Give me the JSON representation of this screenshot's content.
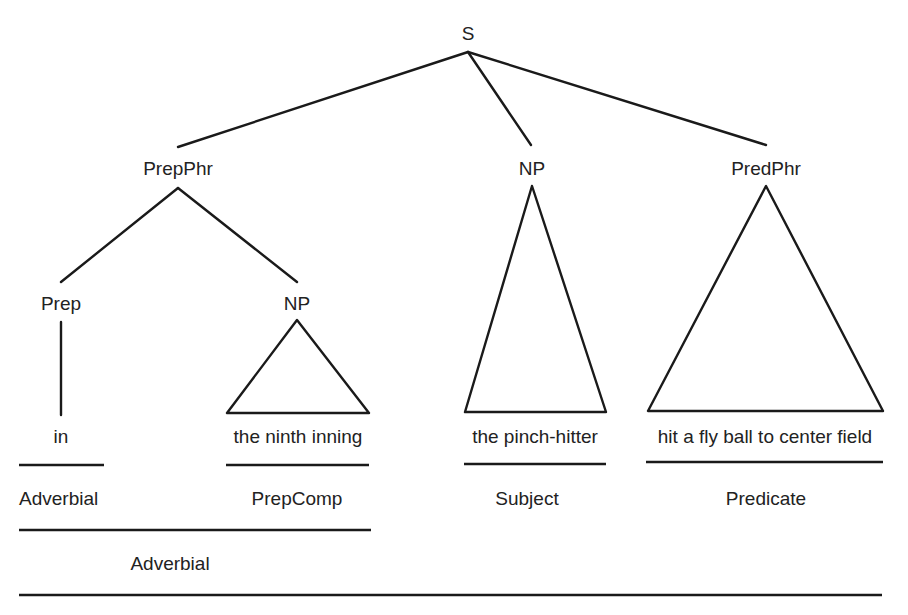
{
  "tree": {
    "root": {
      "label": "S",
      "x": 468,
      "y": 40,
      "apex_y": 52
    },
    "level1": [
      {
        "label": "PrepPhr",
        "x": 178,
        "y": 175,
        "join_y": 147
      },
      {
        "label": "NP",
        "x": 532,
        "y": 175,
        "join_y": 145
      },
      {
        "label": "PredPhr",
        "x": 766,
        "y": 175,
        "join_y": 145
      }
    ],
    "level2": [
      {
        "label": "Prep",
        "x": 61,
        "y": 310
      },
      {
        "label": "NP",
        "x": 297,
        "y": 310
      }
    ],
    "words": [
      {
        "text": "in",
        "x": 61,
        "y": 443
      },
      {
        "text": "the ninth inning",
        "x": 298,
        "y": 443
      },
      {
        "text": "the pinch-hitter",
        "x": 535,
        "y": 443
      },
      {
        "text": "hit a fly ball to center field",
        "x": 765,
        "y": 443
      }
    ],
    "triangles": [
      {
        "name": "np-prepcomp",
        "apex": [
          297,
          320
        ],
        "base_left": [
          227,
          413
        ],
        "base_right": [
          369,
          413
        ]
      },
      {
        "name": "np-subject",
        "apex": [
          532,
          186
        ],
        "base_left": [
          465,
          412
        ],
        "base_right": [
          606,
          412
        ]
      },
      {
        "name": "predphr",
        "apex": [
          766,
          186
        ],
        "base_left": [
          648,
          411
        ],
        "base_right": [
          883,
          411
        ]
      }
    ]
  },
  "functions": {
    "row1": [
      {
        "label": "Adverbial",
        "x": 19,
        "y": 505,
        "anchor": "start"
      },
      {
        "label": "PrepComp",
        "x": 297,
        "y": 505,
        "anchor": "middle"
      },
      {
        "label": "Subject",
        "x": 527,
        "y": 505,
        "anchor": "middle"
      },
      {
        "label": "Predicate",
        "x": 766,
        "y": 505,
        "anchor": "middle"
      }
    ],
    "row2": [
      {
        "label": "Adverbial",
        "x": 170,
        "y": 570,
        "anchor": "middle"
      }
    ]
  },
  "rules": [
    {
      "x1": 19,
      "x2": 104,
      "y": 465
    },
    {
      "x1": 226,
      "x2": 369,
      "y": 465
    },
    {
      "x1": 464,
      "x2": 606,
      "y": 464
    },
    {
      "x1": 646,
      "x2": 883,
      "y": 462
    },
    {
      "x1": 19,
      "x2": 371,
      "y": 530
    },
    {
      "x1": 19,
      "x2": 882,
      "y": 595
    }
  ],
  "colors": {
    "ink": "#1a1a1a",
    "text": "#222222",
    "background": "#ffffff"
  }
}
